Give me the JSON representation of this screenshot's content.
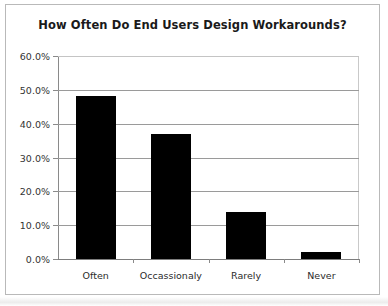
{
  "chart_data": {
    "type": "bar",
    "title": "How Often Do End Users Design Workarounds?",
    "xlabel": "",
    "ylabel": "",
    "categories": [
      "Often",
      "Occassionaly",
      "Rarely",
      "Never"
    ],
    "values": [
      48.3,
      37.0,
      14.0,
      2.0
    ],
    "ylim": [
      0,
      60
    ],
    "ytick_values": [
      0,
      10,
      20,
      30,
      40,
      50,
      60
    ],
    "ytick_labels": [
      "0.0%",
      "10.0%",
      "20.0%",
      "30.0%",
      "40.0%",
      "50.0%",
      "60.0%"
    ],
    "grid": true,
    "legend": null,
    "bar_color": "#000000",
    "gridline_color": "#9a9a9a",
    "border_color": "#b9b9b9",
    "text_color": "#1a1a1a"
  }
}
